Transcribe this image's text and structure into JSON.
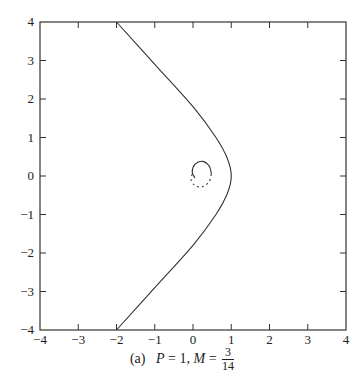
{
  "chart_data": {
    "type": "line",
    "title": "",
    "caption": {
      "label": "(a)",
      "p_text": "P",
      "p_value": "= 1,",
      "m_text": "M",
      "m_eq": "=",
      "m_num": "3",
      "m_den": "14"
    },
    "xlabel": "",
    "ylabel": "",
    "xlim": [
      -4,
      4
    ],
    "ylim": [
      -4,
      4
    ],
    "x_ticks": [
      "-4",
      "-3",
      "-2",
      "-1",
      "0",
      "1",
      "2",
      "3",
      "4"
    ],
    "y_ticks": [
      "-4",
      "-3",
      "-2",
      "-1",
      "0",
      "1",
      "2",
      "3",
      "4"
    ],
    "grid": false,
    "series": [
      {
        "name": "outer trajectory (solid)",
        "style": "solid",
        "points": [
          [
            -2.0,
            4.0
          ],
          [
            -1.0,
            2.9
          ],
          [
            0.0,
            1.8
          ],
          [
            0.6,
            1.0
          ],
          [
            0.9,
            0.45
          ],
          [
            1.0,
            0.0
          ],
          [
            0.9,
            -0.45
          ],
          [
            0.6,
            -1.0
          ],
          [
            0.0,
            -1.8
          ],
          [
            -1.0,
            -2.9
          ],
          [
            -2.0,
            -4.0
          ]
        ]
      },
      {
        "name": "inner spiral (solid)",
        "style": "solid",
        "points": [
          [
            0.05,
            -0.05
          ],
          [
            -0.02,
            0.1
          ],
          [
            0.05,
            0.3
          ],
          [
            0.25,
            0.38
          ],
          [
            0.43,
            0.25
          ],
          [
            0.48,
            0.05
          ]
        ]
      },
      {
        "name": "inner spiral (dashed)",
        "style": "dashed",
        "points": [
          [
            0.48,
            0.05
          ],
          [
            0.42,
            -0.15
          ],
          [
            0.25,
            -0.28
          ],
          [
            0.05,
            -0.25
          ],
          [
            -0.05,
            -0.1
          ],
          [
            -0.02,
            0.05
          ]
        ]
      }
    ]
  }
}
